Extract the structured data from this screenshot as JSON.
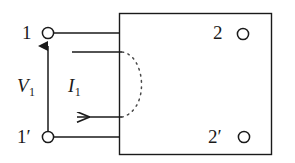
{
  "figure": {
    "type": "two-port-network-diagram",
    "stroke_color": "#1a1a1a",
    "background_color": "#ffffff",
    "dashed_arc_color": "#555555"
  },
  "labels": {
    "port1": "1",
    "port1_prime_base": "1",
    "port1_prime_mark": "′",
    "port2": "2",
    "port2_prime_base": "2",
    "port2_prime_mark": "′",
    "voltage_symbol": "V",
    "voltage_subscript": "1",
    "current_symbol": "I",
    "current_subscript": "1"
  },
  "terminals": [
    {
      "name": "terminal-1",
      "label": "1",
      "x": 48,
      "y": 33,
      "r": 6
    },
    {
      "name": "terminal-1p",
      "label": "1′",
      "x": 48,
      "y": 137,
      "r": 6
    },
    {
      "name": "terminal-2",
      "label": "2",
      "x": 243,
      "y": 33,
      "r": 6
    },
    {
      "name": "terminal-2p",
      "label": "2′",
      "x": 243,
      "y": 137,
      "r": 6
    }
  ],
  "box": {
    "name": "network-box",
    "x": 119,
    "y": 13,
    "width": 153,
    "height": 142
  },
  "arrows": {
    "voltage_arrow": {
      "direction": "up",
      "from_y": 137,
      "to_y": 40,
      "x": 48
    },
    "current_arrow": {
      "direction": "left",
      "from_x": 122,
      "to_x": 70,
      "y": 117
    }
  },
  "dashed_arc": {
    "start": [
      122,
      52
    ],
    "end": [
      122,
      117
    ],
    "bulge_x": 148
  }
}
